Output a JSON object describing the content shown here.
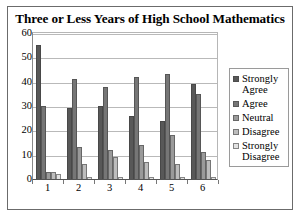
{
  "chart_data": {
    "type": "bar",
    "title": "Three or Less Years of High School Mathematics",
    "xlabel": "",
    "ylabel": "",
    "ylim": [
      0,
      60
    ],
    "ytick_step": 10,
    "yticks": [
      0,
      10,
      20,
      30,
      40,
      50,
      60
    ],
    "grid": true,
    "legend_position": "right",
    "categories": [
      "1",
      "2",
      "3",
      "4",
      "5",
      "6"
    ],
    "series": [
      {
        "name": "Strongly Agree",
        "color": "#585858",
        "values": [
          55,
          29,
          30,
          26,
          24,
          39
        ]
      },
      {
        "name": "Agree",
        "color": "#767676",
        "values": [
          30,
          41,
          38,
          42,
          43,
          35
        ]
      },
      {
        "name": "Neutral",
        "color": "#9a9a9a",
        "values": [
          3,
          13,
          12,
          14,
          18,
          11
        ]
      },
      {
        "name": "Disagree",
        "color": "#bdbdbd",
        "values": [
          3,
          6,
          9,
          7,
          6,
          8
        ]
      },
      {
        "name": "Strongly Disagree",
        "color": "#e2e2e2",
        "values": [
          2,
          1,
          1,
          1,
          1,
          1
        ]
      }
    ]
  },
  "legend": {
    "items": [
      {
        "label": "Strongly Agree",
        "color": "#585858"
      },
      {
        "label": "Agree",
        "color": "#767676"
      },
      {
        "label": "Neutral",
        "color": "#9a9a9a"
      },
      {
        "label": "Disagree",
        "color": "#bdbdbd"
      },
      {
        "label": "Strongly Disagree",
        "color": "#e2e2e2"
      }
    ]
  }
}
